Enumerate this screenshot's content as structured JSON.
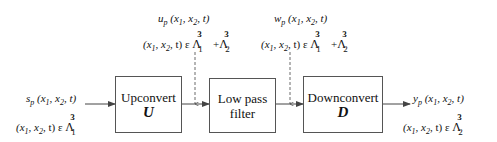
{
  "blocks": [
    {
      "id": "upconvert",
      "label": "Upconvert",
      "symbol": "U"
    },
    {
      "id": "lowpass",
      "label_line1": "Low pass",
      "label_line2": "filter"
    },
    {
      "id": "downconvert",
      "label": "Downconvert",
      "symbol": "D"
    }
  ],
  "signals": {
    "input": {
      "name": "s",
      "sub": "p",
      "args": "(x",
      "a1": "1",
      "mid": ", x",
      "a2": "2",
      "end": ", t)",
      "domain_prefix": "(x",
      "d1": "1",
      "dmid": ", x",
      "d2": "2",
      "dend": ", t) ε",
      "lattice": "Λ",
      "lat_sup": "3",
      "lat_sub": "1"
    },
    "after_up": {
      "name": "u",
      "sub": "p",
      "args": "(x",
      "a1": "1",
      "mid": ", x",
      "a2": "2",
      "end": ", t)",
      "domain_prefix": "(x",
      "d1": "1",
      "dmid": ", x",
      "d2": "2",
      "dend": ", t) ε",
      "lattice": "Λ",
      "lat_sup": "3",
      "lat_sub": "1",
      "plus": "+",
      "lattice2": "Λ",
      "lat2_sup": "3",
      "lat2_sub": "2"
    },
    "after_lp": {
      "name": "w",
      "sub": "p",
      "args": "(x",
      "a1": "1",
      "mid": ", x",
      "a2": "2",
      "end": ", t)",
      "domain_prefix": "(x",
      "d1": "1",
      "dmid": ", x",
      "d2": "2",
      "dend": ", t) ε",
      "lattice": "Λ",
      "lat_sup": "3",
      "lat_sub": "1",
      "plus": "+",
      "lattice2": "Λ",
      "lat2_sup": "3",
      "lat2_sub": "2"
    },
    "output": {
      "name": "y",
      "sub": "p",
      "args": "(x",
      "a1": "1",
      "mid": ", x",
      "a2": "2",
      "end": ", t)",
      "domain_prefix": "(x",
      "d1": "1",
      "dmid": ", x",
      "d2": "2",
      "dend": ", t) ε",
      "lattice": "Λ",
      "lat_sup": "3",
      "lat_sub": "2"
    }
  },
  "colors": {
    "line": "#444444",
    "box_border": "#555555",
    "text": "#111111"
  }
}
